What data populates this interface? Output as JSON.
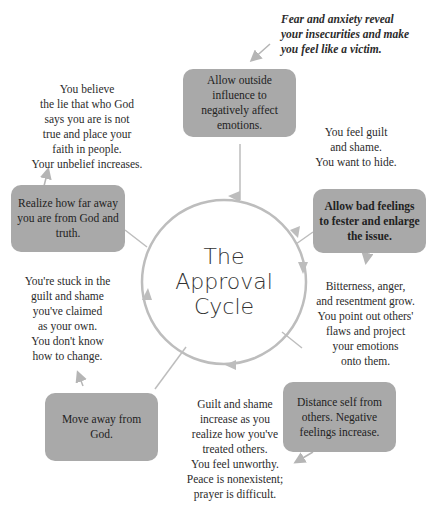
{
  "diagram": {
    "title": "The\nApproval\nCycle",
    "intro_note": "Fear and anxiety reveal\nyour insecurities and make\nyou feel like a victim.",
    "steps": [
      {
        "id": "step1",
        "label": "Allow outside influence to negatively affect emotions.",
        "bold": false
      },
      {
        "id": "step2",
        "label": "Allow bad feelings to fester and enlarge the issue.",
        "bold": true
      },
      {
        "id": "step3",
        "label": "Distance self from others. Negative feelings increase.",
        "bold": false
      },
      {
        "id": "step4",
        "label": "Move away from God.",
        "bold": false
      },
      {
        "id": "step5",
        "label": "Realize how far away you are from God and truth.",
        "bold": false
      }
    ],
    "notes": [
      {
        "id": "note1",
        "text": "You feel guilt\nand shame.\nYou want to hide."
      },
      {
        "id": "note2",
        "text": "Bitterness, anger,\nand resentment grow.\nYou point out others'\nflaws and project\nyour emotions\nonto them."
      },
      {
        "id": "note3",
        "text": "Guilt and shame\nincrease as you\nrealize how you've\ntreated others.\nYou feel unworthy.\nPeace is nonexistent;\nprayer is difficult."
      },
      {
        "id": "note4",
        "text": "You're stuck in the\nguilt and shame\nyou've claimed\nas your own.\nYou don't know\nhow to change."
      },
      {
        "id": "note5",
        "text": "You believe\nthe lie that who God\nsays you are is not\ntrue and place your\nfaith in people.\nYour unbelief increases."
      }
    ],
    "colors": {
      "box_fill": "#a9a9a9",
      "line": "#b5b5b5",
      "text": "#2b2b2b"
    }
  }
}
